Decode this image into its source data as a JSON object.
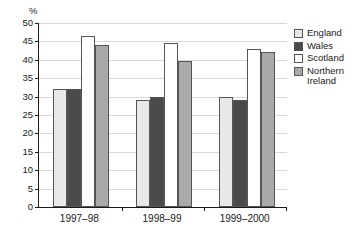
{
  "chart_data": {
    "type": "bar",
    "title": "",
    "subtitle": "",
    "xlabel": "",
    "ylabel": "%",
    "ylim": [
      0,
      50
    ],
    "ytick_step": 5,
    "ytick_labels": [
      "0",
      "5",
      "10",
      "15",
      "20",
      "25",
      "30",
      "35",
      "40",
      "45",
      "50"
    ],
    "grid": true,
    "legend_position": "right",
    "categories": [
      "1997–98",
      "1998–99",
      "1999–2000"
    ],
    "series": [
      {
        "name": "England",
        "color": "#e8e8e8",
        "values": [
          32,
          29,
          30
        ]
      },
      {
        "name": "Wales",
        "color": "#4a4a4a",
        "values": [
          32,
          30,
          29
        ]
      },
      {
        "name": "Scotland",
        "color": "#ffffff",
        "values": [
          46.5,
          44.5,
          43
        ]
      },
      {
        "name": "Northern Ireland",
        "color": "#a9a9a9",
        "values": [
          44,
          39.8,
          42
        ]
      }
    ]
  },
  "legend": {
    "items": [
      {
        "label": "England"
      },
      {
        "label": "Wales"
      },
      {
        "label": "Scotland"
      },
      {
        "label": "Northern\nIreland"
      }
    ]
  },
  "axis": {
    "percent_symbol": "%"
  }
}
